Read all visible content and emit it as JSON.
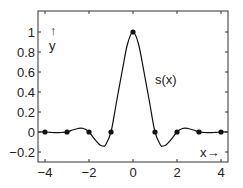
{
  "chart_data": {
    "type": "line",
    "title": "",
    "xlabel": "x→",
    "ylabel": "↑ y",
    "curve_label": "s(x)",
    "xlim": [
      -4.3,
      4.3
    ],
    "ylim": [
      -0.3,
      1.2
    ],
    "grid": false,
    "x_ticks": [
      -4,
      -2,
      0,
      2,
      4
    ],
    "x_tick_labels": [
      "−4",
      "−2",
      "0",
      "2",
      "4"
    ],
    "y_ticks": [
      -0.2,
      0,
      0.2,
      0.4,
      0.6,
      0.8,
      1
    ],
    "y_tick_labels": [
      "−0.2",
      "0",
      "0.2",
      "0.4",
      "0.6",
      "0.8",
      "1"
    ],
    "series": [
      {
        "name": "s(x)",
        "x": [
          -4.3,
          -4,
          -3.75,
          -3.5,
          -3.25,
          -3,
          -2.75,
          -2.5,
          -2.25,
          -2,
          -1.75,
          -1.5,
          -1.35,
          -1.25,
          -1,
          -0.75,
          -0.5,
          -0.25,
          0,
          0.25,
          0.5,
          0.75,
          1,
          1.25,
          1.35,
          1.5,
          1.75,
          2,
          2.25,
          2.5,
          2.75,
          3,
          3.25,
          3.5,
          3.75,
          4,
          4.3
        ],
        "values": [
          0,
          0,
          -0.004,
          -0.007,
          -0.005,
          0,
          0.02,
          0.035,
          0.035,
          0,
          -0.07,
          -0.13,
          -0.14,
          -0.13,
          0,
          0.3,
          0.6,
          0.88,
          1,
          0.88,
          0.6,
          0.3,
          0,
          -0.13,
          -0.14,
          -0.13,
          -0.07,
          0,
          0.035,
          0.035,
          0.02,
          0,
          -0.005,
          -0.007,
          -0.004,
          0,
          0
        ]
      }
    ],
    "markers": {
      "x": [
        -4,
        -3,
        -2,
        -1,
        0,
        1,
        2,
        3,
        4
      ],
      "y": [
        0,
        0,
        0,
        0,
        1,
        0,
        0,
        0,
        0
      ]
    }
  }
}
